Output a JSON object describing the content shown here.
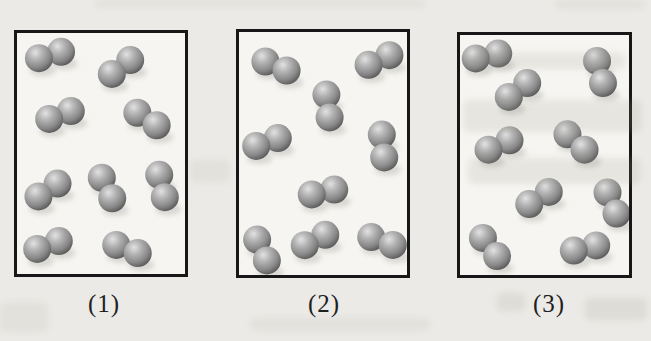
{
  "figure": {
    "panels": [
      {
        "label": "(1)",
        "molecule_count": 9,
        "molecules": [
          {
            "x": 33,
            "y": 22,
            "angle": -16
          },
          {
            "x": 104,
            "y": 34,
            "angle": -37
          },
          {
            "x": 43,
            "y": 82,
            "angle": -20
          },
          {
            "x": 130,
            "y": 86,
            "angle": 33
          },
          {
            "x": 31,
            "y": 157,
            "angle": -34
          },
          {
            "x": 90,
            "y": 155,
            "angle": 63
          },
          {
            "x": 145,
            "y": 153,
            "angle": 76
          },
          {
            "x": 31,
            "y": 212,
            "angle": -20
          },
          {
            "x": 110,
            "y": 216,
            "angle": 21
          }
        ]
      },
      {
        "label": "(2)",
        "molecule_count": 9,
        "molecules": [
          {
            "x": 37,
            "y": 34,
            "angle": 23
          },
          {
            "x": 140,
            "y": 28,
            "angle": -25
          },
          {
            "x": 89,
            "y": 74,
            "angle": 82
          },
          {
            "x": 28,
            "y": 110,
            "angle": -20
          },
          {
            "x": 144,
            "y": 114,
            "angle": 84
          },
          {
            "x": 84,
            "y": 160,
            "angle": -12
          },
          {
            "x": 23,
            "y": 218,
            "angle": 65
          },
          {
            "x": 76,
            "y": 208,
            "angle": -27
          },
          {
            "x": 143,
            "y": 209,
            "angle": 20
          }
        ]
      },
      {
        "label": "(3)",
        "molecule_count": 9,
        "molecules": [
          {
            "x": 27,
            "y": 21,
            "angle": -12
          },
          {
            "x": 140,
            "y": 37,
            "angle": 75
          },
          {
            "x": 58,
            "y": 55,
            "angle": -37
          },
          {
            "x": 39,
            "y": 110,
            "angle": -24
          },
          {
            "x": 116,
            "y": 107,
            "angle": 42
          },
          {
            "x": 79,
            "y": 163,
            "angle": -32
          },
          {
            "x": 152,
            "y": 168,
            "angle": 67
          },
          {
            "x": 30,
            "y": 212,
            "angle": 52
          },
          {
            "x": 125,
            "y": 213,
            "angle": -13
          }
        ]
      }
    ],
    "particle": {
      "kind": "diatomic-molecule-sphere-pair",
      "atom_radius": 14,
      "bond_half_length": 11.5
    },
    "colors": {
      "sphere_highlight": "#e2e2e2",
      "sphere_mid": "#a9a9a9",
      "sphere_dark": "#565656",
      "box_border": "#171717",
      "box_background": "#f6f5f1",
      "page_background": "#ebeae6",
      "label_color": "#1f1f1f"
    }
  }
}
